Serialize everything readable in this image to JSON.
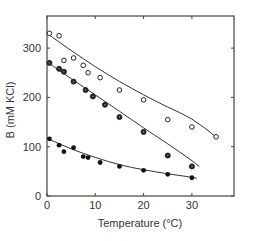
{
  "chart_data": {
    "type": "scatter",
    "title": "",
    "xlabel": "Temperature (°C)",
    "ylabel": "B (mM KCl)",
    "xlim": [
      0,
      38
    ],
    "ylim": [
      0,
      360
    ],
    "xticks": [
      0,
      10,
      20,
      30
    ],
    "yticks": [
      0,
      100,
      200,
      300
    ],
    "grid": false,
    "legend": null,
    "series": [
      {
        "name": "open circles",
        "marker": "open-circle",
        "fit_line": true,
        "points": [
          [
            0.5,
            330
          ],
          [
            2.5,
            325
          ],
          [
            3.5,
            275
          ],
          [
            5.5,
            280
          ],
          [
            7.5,
            265
          ],
          [
            8.5,
            250
          ],
          [
            11,
            240
          ],
          [
            15,
            215
          ],
          [
            20,
            195
          ],
          [
            25,
            155
          ],
          [
            30,
            140
          ],
          [
            35,
            120
          ]
        ]
      },
      {
        "name": "half-filled circles",
        "marker": "filled-circle-ring",
        "fit_line": true,
        "points": [
          [
            0.5,
            270
          ],
          [
            2.5,
            258
          ],
          [
            3.5,
            252
          ],
          [
            5.5,
            232
          ],
          [
            8,
            215
          ],
          [
            9.5,
            202
          ],
          [
            12,
            185
          ],
          [
            15,
            160
          ],
          [
            20,
            130
          ],
          [
            25,
            82
          ],
          [
            30,
            60
          ]
        ]
      },
      {
        "name": "filled circles",
        "marker": "filled-circle",
        "fit_line": true,
        "points": [
          [
            0.5,
            116
          ],
          [
            2.5,
            103
          ],
          [
            3.5,
            90
          ],
          [
            5.5,
            98
          ],
          [
            7.5,
            80
          ],
          [
            8.5,
            78
          ],
          [
            11,
            68
          ],
          [
            15,
            60
          ],
          [
            20,
            52
          ],
          [
            25,
            44
          ],
          [
            30,
            37
          ]
        ]
      }
    ],
    "fits": [
      {
        "series": 0,
        "x": [
          0,
          5,
          10,
          15,
          20,
          25,
          30,
          35
        ],
        "y": [
          330,
          295,
          262,
          232,
          205,
          180,
          158,
          120
        ]
      },
      {
        "series": 1,
        "x": [
          0,
          5,
          10,
          15,
          20,
          25,
          30,
          31.5
        ],
        "y": [
          272,
          238,
          205,
          172,
          138,
          106,
          72,
          60
        ]
      },
      {
        "series": 2,
        "x": [
          0,
          5,
          10,
          15,
          20,
          25,
          30,
          31
        ],
        "y": [
          117,
          95,
          78,
          63,
          53,
          45,
          38,
          36
        ]
      }
    ]
  },
  "axes": {
    "x_title": "Temperature (°C)",
    "y_title": "B (mM KCl)",
    "x_tick_labels": [
      "0",
      "10",
      "20",
      "30"
    ],
    "y_tick_labels": [
      "0",
      "100",
      "200",
      "300"
    ]
  }
}
